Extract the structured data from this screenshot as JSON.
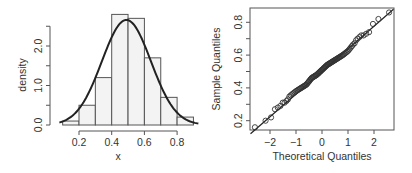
{
  "chart_data": [
    {
      "type": "bar",
      "subtype": "histogram-with-density-curve",
      "xlabel": "x",
      "ylabel": "density",
      "xlim": [
        0.08,
        0.95
      ],
      "ylim": [
        0,
        2.9
      ],
      "x_ticks": [
        0.2,
        0.4,
        0.6,
        0.8
      ],
      "x_tick_labels": [
        "0.2",
        "0.4",
        "0.6",
        "0.8"
      ],
      "y_ticks": [
        0.0,
        0.5,
        1.0,
        1.5,
        2.0,
        2.5
      ],
      "y_tick_labels": [
        "0.0",
        "",
        "1.0",
        "",
        "2.0",
        ""
      ],
      "bins": [
        {
          "from": 0.1,
          "to": 0.2,
          "density": 0.1
        },
        {
          "from": 0.2,
          "to": 0.3,
          "density": 0.5
        },
        {
          "from": 0.3,
          "to": 0.4,
          "density": 1.2
        },
        {
          "from": 0.4,
          "to": 0.5,
          "density": 2.8
        },
        {
          "from": 0.5,
          "to": 0.6,
          "density": 2.7
        },
        {
          "from": 0.6,
          "to": 0.7,
          "density": 1.7
        },
        {
          "from": 0.7,
          "to": 0.8,
          "density": 0.7
        },
        {
          "from": 0.8,
          "to": 0.9,
          "density": 0.2
        }
      ],
      "density_curve": {
        "distribution": "normal",
        "mean": 0.49,
        "sd": 0.15,
        "x_range": [
          0.08,
          0.93
        ]
      },
      "grid": false,
      "legend": "none"
    },
    {
      "type": "scatter",
      "subtype": "normal-qq-plot",
      "xlabel": "Theoretical Quantiles",
      "ylabel": "Sample Quantiles",
      "xlim": [
        -2.75,
        2.75
      ],
      "ylim": [
        0.13,
        0.89
      ],
      "x_ticks": [
        -2,
        -1,
        0,
        1,
        2
      ],
      "x_tick_labels": [
        "−2",
        "−1",
        "0",
        "1",
        "2"
      ],
      "y_ticks": [
        0.2,
        0.3,
        0.4,
        0.5,
        0.6,
        0.7,
        0.8
      ],
      "y_tick_labels": [
        "0.2",
        "",
        "0.4",
        "",
        "0.6",
        "",
        "0.8"
      ],
      "reference_line": {
        "intercept": 0.5,
        "slope": 0.138
      },
      "n_points": 100,
      "points_tail_low": [
        [
          -2.58,
          0.16
        ],
        [
          -2.17,
          0.2
        ],
        [
          -1.96,
          0.22
        ],
        [
          -1.81,
          0.27
        ],
        [
          -1.7,
          0.28
        ],
        [
          -1.6,
          0.29
        ],
        [
          -1.51,
          0.31
        ],
        [
          -1.44,
          0.31
        ],
        [
          -1.37,
          0.32
        ],
        [
          -1.31,
          0.33
        ]
      ],
      "points_tail_high": [
        [
          1.31,
          0.69
        ],
        [
          1.37,
          0.7
        ],
        [
          1.44,
          0.71
        ],
        [
          1.51,
          0.72
        ],
        [
          1.6,
          0.72
        ],
        [
          1.7,
          0.73
        ],
        [
          1.81,
          0.74
        ],
        [
          1.96,
          0.79
        ],
        [
          2.17,
          0.82
        ],
        [
          2.58,
          0.86
        ]
      ],
      "points_body_wobble": [
        [
          -1.2,
          0.355
        ],
        [
          -1.0,
          0.38
        ],
        [
          -0.8,
          0.4
        ],
        [
          -0.6,
          0.42
        ],
        [
          -0.4,
          0.46
        ],
        [
          -0.2,
          0.48
        ],
        [
          0.0,
          0.51
        ],
        [
          0.2,
          0.54
        ],
        [
          0.4,
          0.56
        ],
        [
          0.6,
          0.58
        ],
        [
          0.8,
          0.6
        ],
        [
          1.0,
          0.625
        ],
        [
          1.2,
          0.665
        ]
      ],
      "grid": false,
      "legend": "none"
    }
  ]
}
